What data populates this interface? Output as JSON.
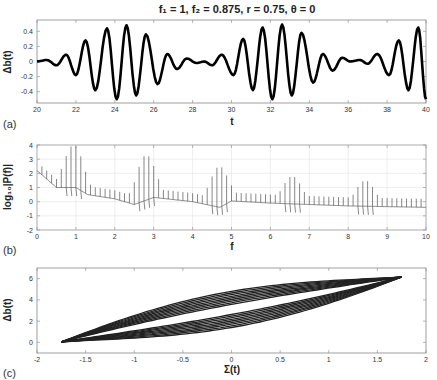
{
  "figure": {
    "title": "f₁ = 1,  f₂ = 0.875,  r = 0.75,  θ = 0",
    "title_parts": {
      "f1": "1",
      "f2": "0.875",
      "r": "0.75",
      "theta": "0"
    }
  },
  "chart_data": [
    {
      "id": "a",
      "panel_label": "(a)",
      "type": "line",
      "title": "",
      "xlabel": "t",
      "ylabel": "Δb(t)",
      "xlim": [
        20,
        40
      ],
      "ylim": [
        -0.55,
        0.55
      ],
      "xticks": [
        20,
        22,
        24,
        26,
        28,
        30,
        32,
        34,
        36,
        38,
        40
      ],
      "yticks": [
        -0.4,
        -0.2,
        0,
        0.2,
        0.4
      ],
      "ytick_labels": [
        "-0.4",
        "-0.2",
        "0",
        "0.2",
        "0.4"
      ],
      "grid": false,
      "line_color": "#000000",
      "line_width": 2.6,
      "series": [
        {
          "name": "Δb(t)",
          "description": "beating oscillation, carrier ~1 Hz, envelope period ~8",
          "x_peaks": [
            21.5,
            22.5,
            23.6,
            24.6,
            25.6,
            26.7,
            29.5,
            30.6,
            31.6,
            32.6,
            33.6,
            34.7,
            37.5,
            38.6,
            39.6
          ],
          "y_peaks": [
            0.09,
            0.28,
            0.44,
            0.48,
            0.36,
            0.1,
            0.09,
            0.3,
            0.45,
            0.49,
            0.38,
            0.1,
            0.1,
            0.28,
            0.45
          ],
          "x_troughs": [
            22.0,
            23.0,
            24.1,
            25.1,
            26.2,
            30.1,
            31.1,
            32.1,
            33.1,
            34.2,
            38.1,
            39.1,
            40.0
          ],
          "y_troughs": [
            -0.18,
            -0.38,
            -0.5,
            -0.45,
            -0.3,
            -0.18,
            -0.38,
            -0.5,
            -0.45,
            -0.28,
            -0.18,
            -0.38,
            -0.5
          ]
        }
      ]
    },
    {
      "id": "b",
      "panel_label": "(b)",
      "type": "line",
      "xlabel": "f",
      "ylabel": "log₁₀|P(f)|",
      "xlim": [
        0,
        10
      ],
      "ylim": [
        -2,
        4
      ],
      "xticks": [
        0,
        1,
        2,
        3,
        4,
        5,
        6,
        7,
        8,
        9,
        10
      ],
      "yticks": [
        -2,
        -1,
        0,
        1,
        2,
        3,
        4
      ],
      "grid": true,
      "line_color": "#555555",
      "series": [
        {
          "name": "log10|P(f)|",
          "baseline_x": [
            0,
            0.5,
            1.0,
            1.3,
            2.0,
            2.5,
            3.0,
            4.0,
            4.7,
            5.0,
            6.0,
            7.0,
            8.0,
            9.0,
            10.0
          ],
          "baseline_y": [
            2.2,
            1.0,
            1.0,
            0.5,
            0.2,
            -0.2,
            0.3,
            0.0,
            -0.4,
            0.05,
            -0.1,
            -0.2,
            -0.3,
            -0.35,
            -0.4
          ],
          "spike_spacing": 0.125,
          "clusters": [
            {
              "center": 0.94,
              "peak": 4.0
            },
            {
              "center": 2.81,
              "peak": 3.3
            },
            {
              "center": 4.69,
              "peak": 2.5
            },
            {
              "center": 6.56,
              "peak": 1.8
            },
            {
              "center": 8.44,
              "peak": 1.5
            }
          ]
        }
      ]
    },
    {
      "id": "c",
      "panel_label": "(c)",
      "type": "line",
      "xlabel": "Σ(t)",
      "ylabel": "Δb(t)",
      "xlim": [
        -2,
        2
      ],
      "ylim": [
        -1,
        7
      ],
      "xticks": [
        -2,
        -1.5,
        -1,
        -0.5,
        0,
        0.5,
        1,
        1.5,
        2
      ],
      "xtick_labels": [
        "-2",
        "-1.5",
        "-1",
        "-0.5",
        "0",
        "0.5",
        "1",
        "1.5",
        "2"
      ],
      "yticks": [
        0,
        2,
        4,
        6
      ],
      "grid": false,
      "line_color": "#222222",
      "series": [
        {
          "name": "phase portrait",
          "description": "nested lens-shaped loops from (-1.75, 0) to (1.75, 6.1)",
          "start": [
            -1.75,
            0.05
          ],
          "end": [
            1.75,
            6.15
          ],
          "loops": 9
        }
      ]
    }
  ]
}
